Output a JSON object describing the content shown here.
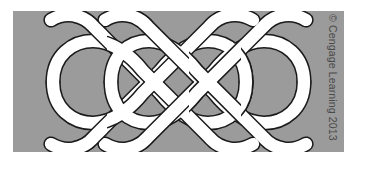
{
  "figure": {
    "credit": "© Cengage Learning 2013",
    "colors": {
      "page_background": "#ffffff",
      "panel_background": "#9b9b9b",
      "band_fill": "#ffffff",
      "band_outline": "#1a1a1a",
      "band_shadow": "#6f6f6f",
      "credit_text": "#4a4a4a"
    },
    "panel": {
      "x": 13,
      "y": 11,
      "width": 331,
      "height": 141
    },
    "knot": {
      "type": "celtic-braid",
      "band_width": 12,
      "outline_width": 1.4,
      "crossings": 16,
      "left_terminals": 2,
      "right_terminals": 2,
      "strand_count": 1
    }
  }
}
